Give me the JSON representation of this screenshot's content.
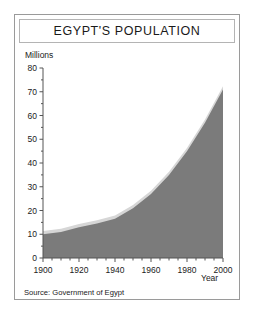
{
  "chart_data": {
    "type": "area",
    "title": "EGYPT'S POPULATION",
    "xlabel": "Year",
    "ylabel": "Millions",
    "source": "Source: Government of Egypt",
    "x": [
      1900,
      1910,
      1920,
      1930,
      1940,
      1950,
      1960,
      1970,
      1980,
      1990,
      2000
    ],
    "values": [
      10,
      11,
      13,
      14.5,
      16.5,
      21,
      27,
      35,
      45,
      57,
      71
    ],
    "series": [
      {
        "name": "Population",
        "values": [
          10,
          11,
          13,
          14.5,
          16.5,
          21,
          27,
          35,
          45,
          57,
          71
        ]
      }
    ],
    "xlim": [
      1900,
      2000
    ],
    "ylim": [
      0,
      80
    ],
    "xticks": [
      1900,
      1920,
      1940,
      1960,
      1980,
      2000
    ],
    "xtick_labels": [
      "1900",
      "1920",
      "1940",
      "1960",
      "1980",
      "2000"
    ],
    "yticks": [
      0,
      10,
      20,
      30,
      40,
      50,
      60,
      70,
      80
    ],
    "ytick_labels": [
      "0",
      "10",
      "20",
      "30",
      "40",
      "50",
      "60",
      "70",
      "80"
    ],
    "x_minor_tick_step": 5,
    "y_minor_tick_step": 5,
    "grid": false,
    "legend": null,
    "colors": {
      "area_fill": "#7b7b7b",
      "area_edge": "#d6d6d6",
      "axis": "#555555",
      "text": "#222222",
      "frame": "#9a9a9a",
      "title_box": "#b4b4b4",
      "background": "#ffffff"
    }
  }
}
